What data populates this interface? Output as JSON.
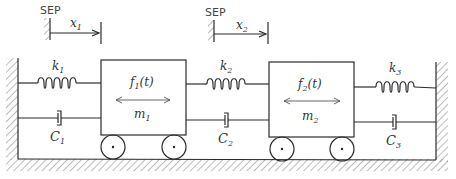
{
  "reference_labels": [
    {
      "id": "sep1",
      "text": "SEP",
      "displacement": "x",
      "sub": "1"
    },
    {
      "id": "sep2",
      "text": "SEP",
      "displacement": "x",
      "sub": "2"
    }
  ],
  "springs": [
    {
      "id": "k1",
      "symbol": "k",
      "sub": "1"
    },
    {
      "id": "k2",
      "symbol": "k",
      "sub": "2"
    },
    {
      "id": "k3",
      "symbol": "k",
      "sub": "3"
    }
  ],
  "dampers": [
    {
      "id": "C1",
      "symbol": "C",
      "sub": "1"
    },
    {
      "id": "C2",
      "symbol": "C",
      "sub": "2"
    },
    {
      "id": "C3",
      "symbol": "C",
      "sub": "3"
    }
  ],
  "masses": [
    {
      "id": "m1",
      "symbol": "m",
      "sub": "1",
      "force": "f",
      "force_sub": "1",
      "force_arg": "(t)"
    },
    {
      "id": "m2",
      "symbol": "m",
      "sub": "2",
      "force": "f",
      "force_sub": "2",
      "force_arg": "(t)"
    }
  ]
}
